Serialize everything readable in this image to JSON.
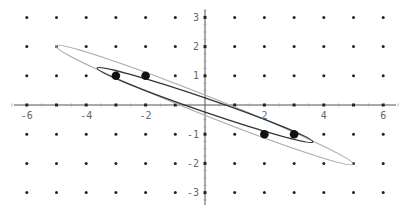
{
  "chart_data": {
    "type": "scatter",
    "title": "",
    "xlabel": "",
    "ylabel": "",
    "xlim": [
      -6.5,
      6.5
    ],
    "ylim": [
      -3.3,
      3.3
    ],
    "grid": "dot-lattice",
    "x_ticks": [
      -6,
      -4,
      -2,
      2,
      4,
      6
    ],
    "y_ticks": [
      -3,
      -2,
      -1,
      1,
      2,
      3
    ],
    "lattice": {
      "x": [
        -6,
        -5,
        -4,
        -3,
        -2,
        -1,
        0,
        1,
        2,
        3,
        4,
        5,
        6
      ],
      "y": [
        -3,
        -2,
        -1,
        0,
        1,
        2,
        3
      ]
    },
    "series": [
      {
        "name": "data points",
        "points": [
          [
            -3,
            1
          ],
          [
            -2,
            1
          ],
          [
            2,
            -1
          ],
          [
            3,
            -1
          ]
        ]
      }
    ],
    "curves": [
      {
        "name": "outer ellipse",
        "center": [
          0,
          0
        ],
        "endpoints": [
          [
            -5,
            2
          ],
          [
            5,
            -2
          ]
        ],
        "color": "#aaaaaa"
      },
      {
        "name": "inner ellipse",
        "center": [
          0,
          0
        ],
        "endpoints": [
          [
            -3.65,
            1.25
          ],
          [
            3.65,
            -1.25
          ]
        ],
        "color": "#333333"
      }
    ]
  },
  "labels": {
    "x": [
      "-6",
      "-4",
      "-2",
      "2",
      "4",
      "6"
    ],
    "y": [
      "3",
      "2",
      "1",
      "-1",
      "-2",
      "-3"
    ]
  }
}
